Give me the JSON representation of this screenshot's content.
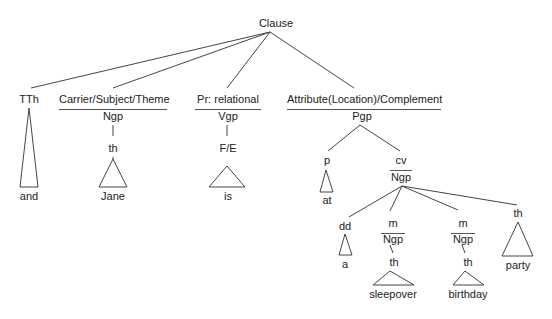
{
  "tree": {
    "root": "Clause",
    "constituents": [
      {
        "function": "TTh",
        "leaf": "and"
      },
      {
        "function": "Carrier/Subject/Theme",
        "class": "Ngp",
        "child_function": "th",
        "leaf": "Jane"
      },
      {
        "function": "Pr: relational",
        "class": "Vgp",
        "child_function": "F/E",
        "leaf": "is"
      },
      {
        "function": "Attribute(Location)/Complement",
        "class": "Pgp",
        "children": [
          {
            "function": "p",
            "leaf": "at"
          },
          {
            "function": "cv",
            "class": "Ngp",
            "children": [
              {
                "function": "dd",
                "leaf": "a"
              },
              {
                "function": "m",
                "class": "Ngp",
                "child_function": "th",
                "leaf": "sleepover"
              },
              {
                "function": "m",
                "class": "Ngp",
                "child_function": "th",
                "leaf": "birthday"
              },
              {
                "function": "th",
                "leaf": "party"
              }
            ]
          }
        ]
      }
    ]
  }
}
